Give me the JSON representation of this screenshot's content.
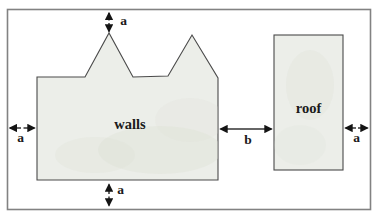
{
  "labels": {
    "walls": "walls",
    "roof": "roof",
    "margin_top": "a",
    "margin_left": "a",
    "margin_bottom": "a",
    "margin_right": "a",
    "gap": "b"
  },
  "colors": {
    "background": "#ffffff",
    "shape_fill": "#eceee9",
    "shape_outline": "#4a4a4a",
    "frame_border": "#828282",
    "arrow": "#141414",
    "text": "#1a1a1a"
  }
}
